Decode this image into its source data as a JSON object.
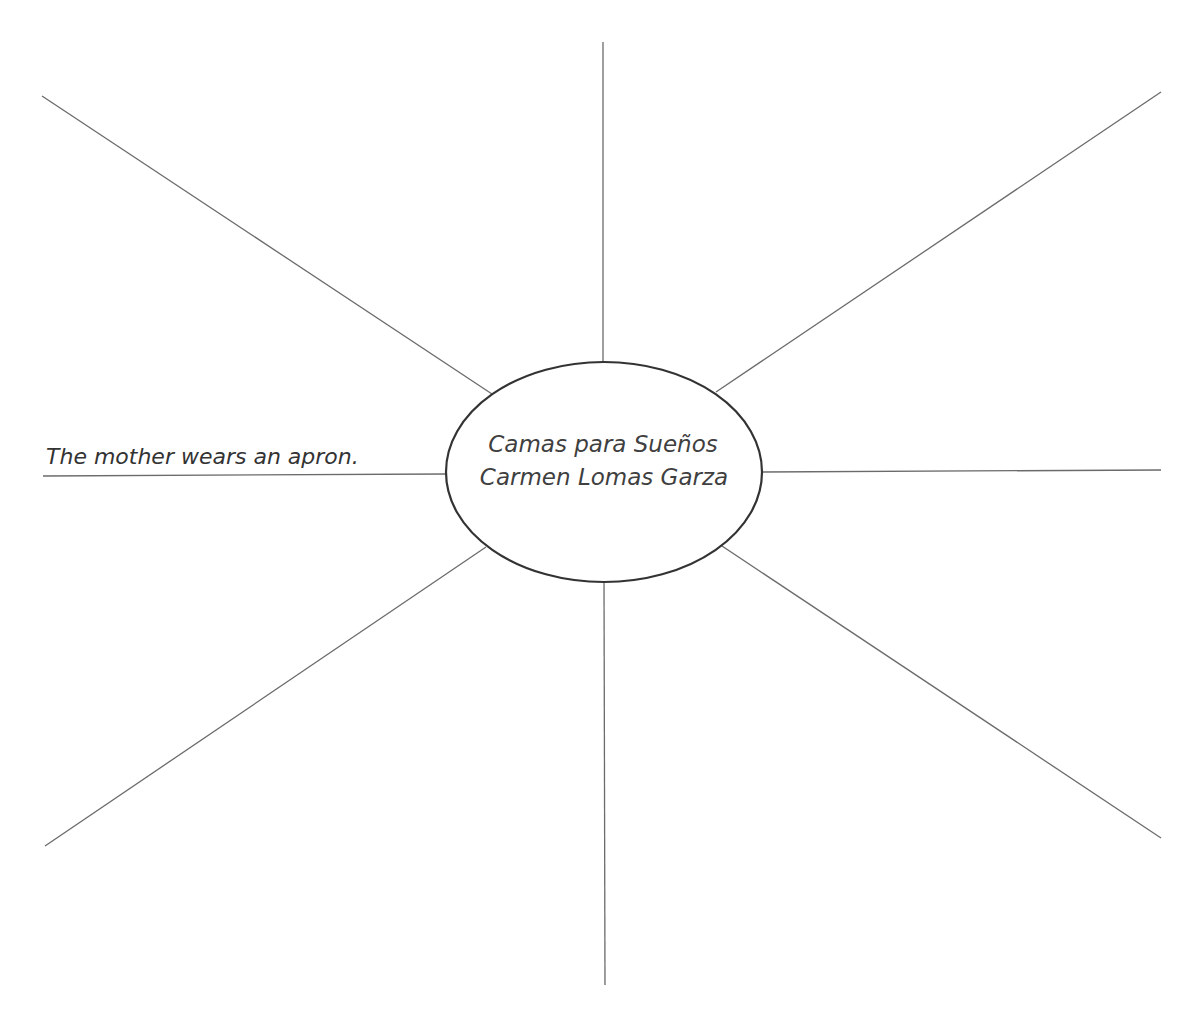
{
  "worksheet": {
    "type": "word-web graphic organizer",
    "center": {
      "title": "Camas para Sueños",
      "artist": "Carmen Lomas Garza"
    },
    "spokes": [
      {
        "position": "top",
        "answer": ""
      },
      {
        "position": "top-right",
        "answer": ""
      },
      {
        "position": "right",
        "answer": ""
      },
      {
        "position": "bottom-right",
        "answer": ""
      },
      {
        "position": "bottom",
        "answer": ""
      },
      {
        "position": "bottom-left",
        "answer": ""
      },
      {
        "position": "left",
        "answer": "The mother wears an apron."
      },
      {
        "position": "top-left",
        "answer": ""
      }
    ]
  },
  "colors": {
    "background": "#ffffff",
    "spoke_line": "#6b6b6b",
    "hub_outline": "#333333",
    "text": "#3f3f3f"
  }
}
